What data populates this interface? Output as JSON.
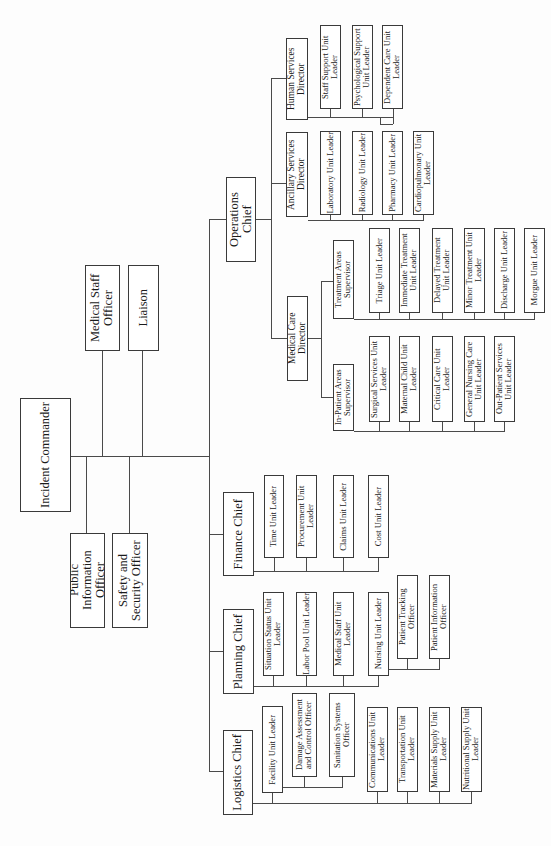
{
  "chart": {
    "orientation": "rotated-90-ccw",
    "root": {
      "label": "Incident Commander",
      "command_staff": [
        {
          "label": "Medical Staff Officer"
        },
        {
          "label": "Liaison"
        },
        {
          "label": "Public Information Officer"
        },
        {
          "label": "Safety and Security Officer"
        }
      ],
      "sections": {
        "operations": {
          "label": "Operations Chief",
          "human_services": {
            "label": "Human Services Director",
            "units": [
              "Staff Support Unit Leader",
              "Psychological Support Unit Leader",
              "Dependent Care Unit Leader"
            ]
          },
          "ancillary_services": {
            "label": "Ancillary Services Director",
            "units": [
              "Laboratory Unit Leader",
              "Radiology Unit Leader",
              "Pharmacy Unit Leader",
              "Cardiopulmonary Unit Leader"
            ]
          },
          "medical_care": {
            "label": "Medical Care Director",
            "treatment_areas": {
              "label": "Treatment Areas Supervisor",
              "units": [
                "Triage Unit Leader",
                "Immediate Treatment Unit Leader",
                "Delayed Treatment Unit Leader",
                "Minor Treatment Unit Leader",
                "Discharge Unit Leader",
                "Morgue Unit Leader"
              ]
            },
            "in_patient_areas": {
              "label": "In-Patient Areas Supervisor",
              "units": [
                "Surgical Services Unit Leader",
                "Maternal Child Unit Leader",
                "Critical Care Unit Leader",
                "General Nursing Care Unit Leader",
                "Out-Patient Services Unit Leader"
              ]
            }
          }
        },
        "finance": {
          "label": "Finance Chief",
          "units": [
            "Time Unit Leader",
            "Procurement Unit Leader",
            "Claims Unit Leader",
            "Cost Unit Leader"
          ]
        },
        "planning": {
          "label": "Planning Chief",
          "units": [
            "Situation Status Unit Leader",
            "Labor Pool Unit Leader",
            "Medical Staff Unit Leader",
            "Nursing Unit Leader"
          ],
          "nursing_sub": [
            "Patient Tracking Officer",
            "Patient Information Officer"
          ]
        },
        "logistics": {
          "label": "Logistics Chief",
          "facility": {
            "label": "Facility Unit Leader",
            "sub": [
              "Damage Assessment and Control Officer",
              "Sanitation Systems Officer"
            ]
          },
          "units": [
            "Communications Unit Leader",
            "Transportation Unit Leader",
            "Materials Supply Unit Leader",
            "Nutritional Supply Unit Leader"
          ]
        }
      }
    }
  }
}
